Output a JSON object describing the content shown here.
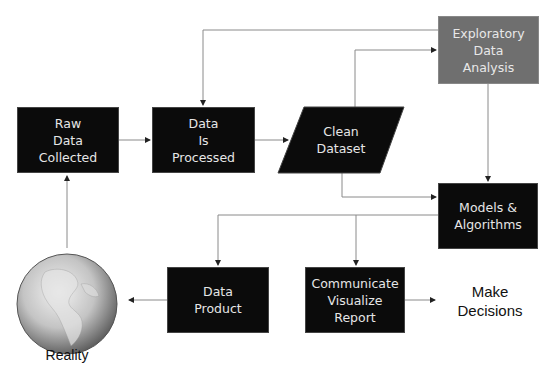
{
  "diagram": {
    "type": "flowchart",
    "colors": {
      "box_fill": "#0b0b0b",
      "box_text": "#e6e6e6",
      "highlight_fill": "#6f6f6f",
      "connector": "#7a7a7a"
    },
    "nodes": {
      "raw_data": {
        "lines": [
          "Raw",
          "Data",
          "Collected"
        ]
      },
      "data_processed": {
        "lines": [
          "Data",
          "Is",
          "Processed"
        ]
      },
      "clean_dataset": {
        "lines": [
          "Clean",
          "Dataset"
        ]
      },
      "eda": {
        "lines": [
          "Exploratory",
          "Data",
          "Analysis"
        ]
      },
      "models": {
        "lines": [
          "Models &",
          "Algorithms"
        ]
      },
      "data_product": {
        "lines": [
          "Data",
          "Product"
        ]
      },
      "communicate": {
        "lines": [
          "Communicate",
          "Visualize",
          "Report"
        ]
      },
      "make_decisions": {
        "lines": [
          "Make",
          "Decisions"
        ]
      },
      "reality": {
        "label": "Reality",
        "icon": "globe-icon"
      }
    },
    "edges": [
      {
        "from": "reality",
        "to": "raw_data"
      },
      {
        "from": "raw_data",
        "to": "data_processed"
      },
      {
        "from": "data_processed",
        "to": "clean_dataset"
      },
      {
        "from": "clean_dataset",
        "to": "eda"
      },
      {
        "from": "clean_dataset",
        "to": "models"
      },
      {
        "from": "eda",
        "to": "data_processed"
      },
      {
        "from": "eda",
        "to": "models"
      },
      {
        "from": "models",
        "to": "data_product"
      },
      {
        "from": "models",
        "to": "communicate"
      },
      {
        "from": "data_product",
        "to": "reality"
      },
      {
        "from": "communicate",
        "to": "make_decisions"
      }
    ]
  }
}
